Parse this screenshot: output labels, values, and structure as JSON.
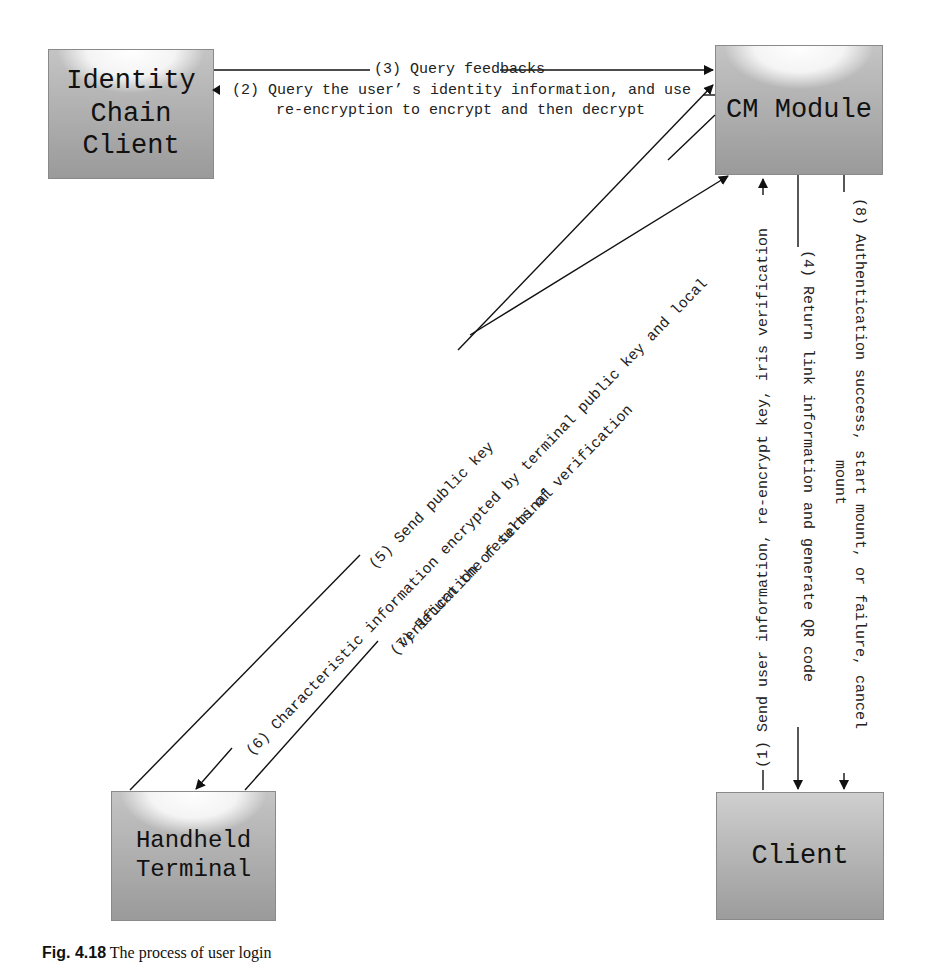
{
  "nodes": {
    "identity_chain_client": "Identity\nChain\nClient",
    "cm_module": "CM Module",
    "handheld_terminal": "Handheld\nTerminal",
    "client": "Client"
  },
  "messages": {
    "m1": "(1) Send user information, re-encrypt key, iris verification",
    "m2_line1": "(2) Query the user’ s identity information, and use",
    "m2_line2": "re-encryption to encrypt and then decrypt",
    "m3": "(3) Query feedbacks",
    "m4": "(4) Return link information and generate QR code",
    "m5": "(5) Send public key",
    "m6_line1": "(6) Characteristic information encrypted by terminal public key and local",
    "m6_line2": "verification of terminal",
    "m7": "(7) Return the results of verification",
    "m8_line1": "(8) Authentication success, start mount, or failure, cancel",
    "m8_line2": "mount"
  },
  "caption": {
    "prefix": "Fig. 4.18",
    "text": "The process of user login"
  }
}
